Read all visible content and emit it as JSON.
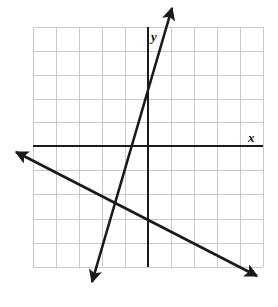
{
  "figure": {
    "title": "",
    "width": 278,
    "height": 307,
    "background": "#ffffff"
  },
  "axis_labels": {
    "x": "x",
    "y": "y"
  },
  "chart_data": {
    "type": "line",
    "title": "",
    "xlabel": "x",
    "ylabel": "y",
    "grid": true,
    "legend": null,
    "coordinate_system": {
      "origin_px": {
        "x": 148,
        "y": 146
      },
      "cell_size_px": 23,
      "grid_left_px": 33,
      "grid_right_px": 263,
      "grid_top_px": 27,
      "grid_bottom_px": 267,
      "columns": 10,
      "rows": 10,
      "xlim": [
        -5,
        5
      ],
      "ylim": [
        -5.26,
        5.17
      ],
      "tick_labels_shown": false
    },
    "style": {
      "grid_color": "#c9c9c9",
      "axis_color": "#1a1a1a",
      "line_color": "#1a1a1a",
      "grid_line_width": 1,
      "axis_line_width": 2.2,
      "data_line_width": 2.6
    },
    "axes": [
      {
        "name": "x-axis",
        "orientation": "horizontal",
        "y_value": 0,
        "pixel_y": 146,
        "from_px": {
          "x": 33,
          "y": 146
        },
        "to_px": {
          "x": 263,
          "y": 146
        },
        "arrowheads": "none",
        "label": "x"
      },
      {
        "name": "y-axis",
        "orientation": "vertical",
        "x_value": 0,
        "pixel_x": 148,
        "from_px": {
          "x": 148,
          "y": 27
        },
        "to_px": {
          "x": 148,
          "y": 267
        },
        "arrowheads": "none",
        "label": "y"
      }
    ],
    "series": [
      {
        "name": "steep-line",
        "description": "steep positive-slope line rising left-to-right",
        "type": "line",
        "arrowheads": "both",
        "color": "#1a1a1a",
        "x_intercept": -1,
        "y_intercept": 5.9,
        "slope": 5.9,
        "equation": "y = 5.9x + 5.9",
        "endpoints_px": [
          {
            "x": 92,
            "y": 282
          },
          {
            "x": 172,
            "y": 8
          }
        ],
        "points": [
          {
            "x": -1.57,
            "y": -5.91
          },
          {
            "x": -1,
            "y": 0
          },
          {
            "x": 0,
            "y": 5.17
          },
          {
            "x": 1.04,
            "y": 6.0
          }
        ]
      },
      {
        "name": "shallow-line",
        "description": "shallow negative-slope line falling left-to-right",
        "type": "line",
        "arrowheads": "both",
        "color": "#1a1a1a",
        "x_intercept": -2.7,
        "y_intercept": -1.35,
        "slope": -0.5,
        "equation": "y = -0.5x - 1.35",
        "endpoints_px": [
          {
            "x": 16,
            "y": 152
          },
          {
            "x": 257,
            "y": 276
          }
        ],
        "points": [
          {
            "x": -5.74,
            "y": 0.26
          },
          {
            "x": -2.7,
            "y": 0
          },
          {
            "x": 0,
            "y": -1.35
          },
          {
            "x": 4.74,
            "y": -5.65
          }
        ]
      }
    ]
  }
}
